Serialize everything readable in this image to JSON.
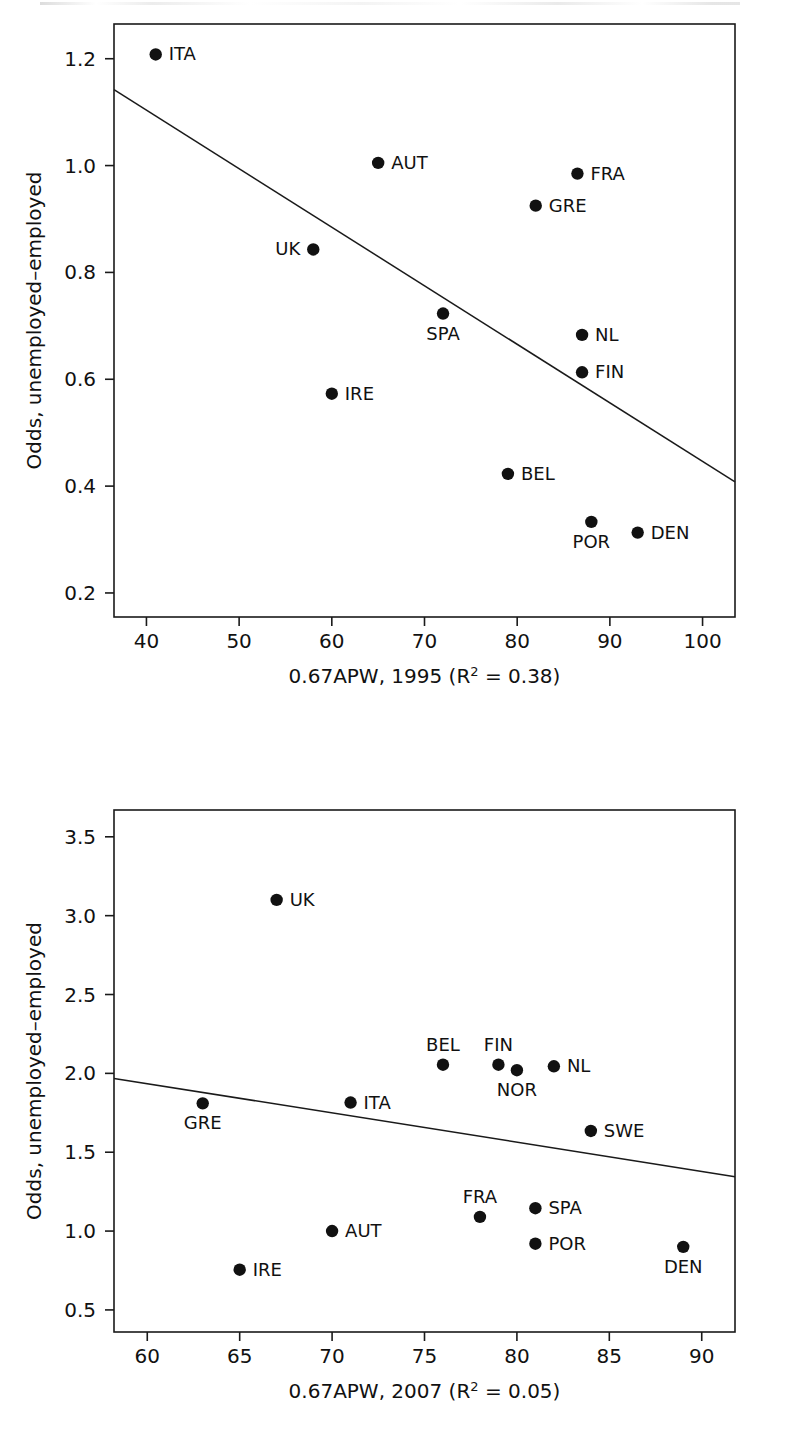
{
  "figure": {
    "kind": "two-panel-scatter",
    "background": "#ffffff",
    "ink_color": "#111111"
  },
  "chart_data": [
    {
      "type": "scatter",
      "panel": "top",
      "title": "",
      "xlabel": "0.67APW, 1995 (R² = 0.38)",
      "ylabel": "Odds, unemployed–employed",
      "xlim": [
        36.5,
        103.5
      ],
      "ylim": [
        0.155,
        1.265
      ],
      "xticks": [
        40,
        50,
        60,
        70,
        80,
        90,
        100
      ],
      "xtick_labels": [
        "40",
        "50",
        "60",
        "70",
        "80",
        "90",
        "100"
      ],
      "yticks": [
        0.2,
        0.4,
        0.6,
        0.8,
        1.0,
        1.2
      ],
      "ytick_labels": [
        "0.2",
        "0.4",
        "0.6",
        "0.8",
        "1.0",
        "1.2"
      ],
      "grid": false,
      "legend": "none",
      "r_squared": 0.38,
      "points": [
        {
          "label": "ITA",
          "x": 41.0,
          "y": 1.208,
          "label_pos": "right"
        },
        {
          "label": "AUT",
          "x": 65.0,
          "y": 1.005,
          "label_pos": "right"
        },
        {
          "label": "FRA",
          "x": 86.5,
          "y": 0.985,
          "label_pos": "right"
        },
        {
          "label": "GRE",
          "x": 82.0,
          "y": 0.925,
          "label_pos": "right"
        },
        {
          "label": "UK",
          "x": 58.0,
          "y": 0.843,
          "label_pos": "left"
        },
        {
          "label": "SPA",
          "x": 72.0,
          "y": 0.723,
          "label_pos": "below"
        },
        {
          "label": "NL",
          "x": 87.0,
          "y": 0.683,
          "label_pos": "right"
        },
        {
          "label": "FIN",
          "x": 87.0,
          "y": 0.613,
          "label_pos": "right"
        },
        {
          "label": "IRE",
          "x": 60.0,
          "y": 0.573,
          "label_pos": "right"
        },
        {
          "label": "BEL",
          "x": 79.0,
          "y": 0.423,
          "label_pos": "right"
        },
        {
          "label": "POR",
          "x": 88.0,
          "y": 0.333,
          "label_pos": "below"
        },
        {
          "label": "DEN",
          "x": 93.0,
          "y": 0.313,
          "label_pos": "right"
        }
      ],
      "fit_line": {
        "x1": 36.5,
        "y1": 1.142,
        "x2": 103.5,
        "y2": 0.408
      }
    },
    {
      "type": "scatter",
      "panel": "bottom",
      "title": "",
      "xlabel": "0.67APW, 2007 (R² = 0.05)",
      "ylabel": "Odds, unemployed–employed",
      "xlim": [
        58.2,
        91.8
      ],
      "ylim": [
        0.36,
        3.67
      ],
      "xticks": [
        60,
        65,
        70,
        75,
        80,
        85,
        90
      ],
      "xtick_labels": [
        "60",
        "65",
        "70",
        "75",
        "80",
        "85",
        "90"
      ],
      "yticks": [
        0.5,
        1.0,
        1.5,
        2.0,
        2.5,
        3.0,
        3.5
      ],
      "ytick_labels": [
        "0.5",
        "1.0",
        "1.5",
        "2.0",
        "2.5",
        "3.0",
        "3.5"
      ],
      "grid": false,
      "legend": "none",
      "r_squared": 0.05,
      "points": [
        {
          "label": "UK",
          "x": 67.0,
          "y": 3.1,
          "label_pos": "right"
        },
        {
          "label": "BEL",
          "x": 76.0,
          "y": 2.055,
          "label_pos": "above"
        },
        {
          "label": "FIN",
          "x": 79.0,
          "y": 2.055,
          "label_pos": "above"
        },
        {
          "label": "NOR",
          "x": 80.0,
          "y": 2.02,
          "label_pos": "below"
        },
        {
          "label": "NL",
          "x": 82.0,
          "y": 2.045,
          "label_pos": "right"
        },
        {
          "label": "GRE",
          "x": 63.0,
          "y": 1.81,
          "label_pos": "below"
        },
        {
          "label": "ITA",
          "x": 71.0,
          "y": 1.815,
          "label_pos": "right"
        },
        {
          "label": "SWE",
          "x": 84.0,
          "y": 1.635,
          "label_pos": "right"
        },
        {
          "label": "SPA",
          "x": 81.0,
          "y": 1.145,
          "label_pos": "right"
        },
        {
          "label": "FRA",
          "x": 78.0,
          "y": 1.09,
          "label_pos": "above"
        },
        {
          "label": "AUT",
          "x": 70.0,
          "y": 1.0,
          "label_pos": "right"
        },
        {
          "label": "POR",
          "x": 81.0,
          "y": 0.92,
          "label_pos": "right"
        },
        {
          "label": "DEN",
          "x": 89.0,
          "y": 0.9,
          "label_pos": "below"
        },
        {
          "label": "IRE",
          "x": 65.0,
          "y": 0.755,
          "label_pos": "right"
        }
      ],
      "fit_line": {
        "x1": 58.2,
        "y1": 1.968,
        "x2": 91.8,
        "y2": 1.345
      }
    }
  ]
}
